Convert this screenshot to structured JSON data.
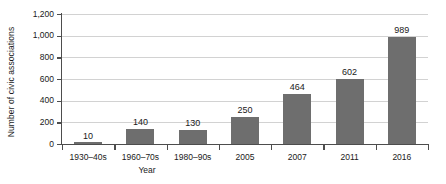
{
  "chart_data": {
    "type": "bar",
    "title": "",
    "xlabel": "Year",
    "ylabel": "Number of civic associations",
    "categories": [
      "1930–40s",
      "1960–70s",
      "1980–90s",
      "2005",
      "2007",
      "2011",
      "2016"
    ],
    "values": [
      10,
      140,
      130,
      250,
      464,
      602,
      989
    ],
    "value_labels": [
      "10",
      "140",
      "130",
      "250",
      "464",
      "602",
      "989"
    ],
    "ylim": [
      0,
      1200
    ],
    "ytick_values": [
      0,
      200,
      400,
      600,
      800,
      1000,
      1200
    ],
    "ytick_labels": [
      "0",
      "200",
      "400",
      "600",
      "800",
      "1,000",
      "1,200"
    ],
    "grid": "horizontal",
    "legend": "none",
    "bar_color": "#6e6e6e",
    "gridline_color": "#d2d2d2",
    "axis_color": "#4d4d4d",
    "background_color": "#ffffff"
  }
}
